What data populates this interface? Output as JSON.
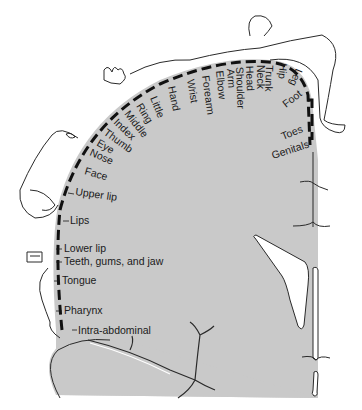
{
  "figure": {
    "type": "sensory homunculus",
    "colors": {
      "cortex_fill": "#c9c9c9",
      "outline": "#2a2a2a",
      "dash": "#111111",
      "background": "#ffffff"
    }
  },
  "labels": {
    "top_arc": [
      {
        "id": "little",
        "text": "Little"
      },
      {
        "id": "hand",
        "text": "Hand"
      },
      {
        "id": "wrist",
        "text": "Wrist"
      },
      {
        "id": "forearm",
        "text": "Forearm"
      },
      {
        "id": "elbow",
        "text": "Elbow"
      },
      {
        "id": "arm",
        "text": "Arm"
      },
      {
        "id": "shoulder",
        "text": "Shoulder"
      },
      {
        "id": "head",
        "text": "Head"
      },
      {
        "id": "neck",
        "text": "Neck"
      },
      {
        "id": "trunk",
        "text": "Trunk"
      },
      {
        "id": "hip",
        "text": "Hip"
      },
      {
        "id": "leg",
        "text": "Leg"
      }
    ],
    "fingers": [
      {
        "id": "ring",
        "text": "Ring"
      },
      {
        "id": "middle",
        "text": "Middle"
      },
      {
        "id": "index",
        "text": "Index"
      },
      {
        "id": "thumb",
        "text": "Thumb"
      },
      {
        "id": "eye",
        "text": "Eye"
      },
      {
        "id": "nose",
        "text": "Nose"
      },
      {
        "id": "face",
        "text": "Face"
      }
    ],
    "left_side": [
      {
        "id": "upper-lip",
        "text": "Upper lip"
      },
      {
        "id": "lips",
        "text": "Lips"
      },
      {
        "id": "lower-lip",
        "text": "Lower lip"
      },
      {
        "id": "teeth",
        "text": "Teeth, gums, and jaw"
      },
      {
        "id": "tongue",
        "text": "Tongue"
      },
      {
        "id": "pharynx",
        "text": "Pharynx"
      },
      {
        "id": "intra-abdominal",
        "text": "Intra-abdominal"
      }
    ],
    "right_side": [
      {
        "id": "foot",
        "text": "Foot"
      },
      {
        "id": "toes",
        "text": "Toes"
      },
      {
        "id": "genitals",
        "text": "Genitals"
      }
    ]
  }
}
